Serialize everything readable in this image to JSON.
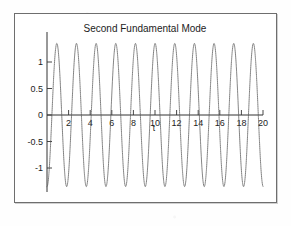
{
  "figure": {
    "title": "Second Fundamental Mode",
    "xlabel": "t",
    "ylabel": ""
  },
  "chart_data": {
    "type": "line",
    "title": "Second Fundamental Mode",
    "xlabel": "t",
    "ylabel": "",
    "xlim": [
      0,
      20
    ],
    "ylim": [
      -1.45,
      1.45
    ],
    "xticks": [
      2,
      4,
      6,
      8,
      10,
      12,
      14,
      16,
      18,
      20
    ],
    "yticks": [
      1,
      0.5,
      0,
      -0.5,
      -1
    ],
    "xtick_labels": [
      "2",
      "4",
      "6",
      "8",
      "10",
      "12",
      "14",
      "16",
      "18",
      "20"
    ],
    "ytick_labels": [
      "1",
      "0.5",
      "0",
      "-0.5",
      "-1"
    ],
    "grid": false,
    "legend": null,
    "linestyle": "dotted",
    "series": [
      {
        "name": "second fundamental mode",
        "amplitude": 1.35,
        "period": 1.82,
        "phase_deg": -90,
        "cycles_shown": 11,
        "formula": "y = 1.35 * cos(2*pi*(t)/1.82 + pi)",
        "x": [
          0,
          0.455,
          0.91,
          1.365,
          1.82,
          2.275,
          2.73,
          3.185,
          3.64,
          4.095,
          4.55,
          5.005,
          5.46,
          5.915,
          6.37,
          6.825,
          7.28,
          7.735,
          8.19,
          8.645,
          9.1,
          9.555,
          10.01,
          10.465,
          10.92,
          11.375,
          11.83,
          12.285,
          12.74,
          13.195,
          13.65,
          14.105,
          14.56,
          15.015,
          15.47,
          15.925,
          16.38,
          16.835,
          17.29,
          17.745,
          18.2,
          18.655,
          19.11,
          19.565,
          20
        ],
        "y": [
          -1.35,
          0,
          1.35,
          0,
          -1.35,
          0,
          1.35,
          0,
          -1.35,
          0,
          1.35,
          0,
          -1.35,
          0,
          1.35,
          0,
          -1.35,
          0,
          1.35,
          0,
          -1.35,
          0,
          1.35,
          0,
          -1.35,
          0,
          1.35,
          0,
          -1.35,
          0,
          1.35,
          0,
          -1.35,
          0,
          1.35,
          0,
          -1.35,
          0,
          1.35,
          0,
          -1.35,
          0,
          1.35,
          0,
          1.0
        ]
      }
    ]
  },
  "ticks": {
    "x": [
      "2",
      "4",
      "6",
      "8",
      "10",
      "12",
      "14",
      "16",
      "18",
      "20"
    ],
    "y": [
      "1",
      "0.5",
      "0",
      "-0.5",
      "-1"
    ]
  }
}
